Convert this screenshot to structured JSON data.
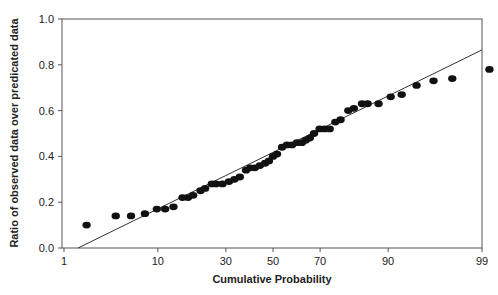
{
  "chart_data": {
    "type": "scatter",
    "title": "",
    "xlabel": "Cumulative Probability",
    "ylabel": "Ratio of observed data over predicated data",
    "x_scale": "normal-probability",
    "xlim": [
      1,
      99
    ],
    "ylim": [
      0.0,
      1.0
    ],
    "x_ticks": [
      1,
      10,
      30,
      50,
      70,
      90,
      99
    ],
    "y_ticks": [
      "0.0",
      "0.2",
      "0.4",
      "0.6",
      "0.8",
      "1.0"
    ],
    "grid": false,
    "legend": "none",
    "series": [
      {
        "name": "observed",
        "points": [
          [
            1.9,
            0.1
          ],
          [
            4.0,
            0.14
          ],
          [
            5.7,
            0.14
          ],
          [
            7.7,
            0.15
          ],
          [
            9.8,
            0.17
          ],
          [
            11.5,
            0.17
          ],
          [
            13.4,
            0.18
          ],
          [
            15.7,
            0.22
          ],
          [
            17.2,
            0.22
          ],
          [
            18.7,
            0.23
          ],
          [
            21.0,
            0.25
          ],
          [
            22.5,
            0.26
          ],
          [
            24.8,
            0.28
          ],
          [
            26.3,
            0.28
          ],
          [
            28.7,
            0.28
          ],
          [
            31.2,
            0.29
          ],
          [
            33.4,
            0.3
          ],
          [
            35.6,
            0.31
          ],
          [
            38.2,
            0.34
          ],
          [
            40.0,
            0.35
          ],
          [
            42.0,
            0.35
          ],
          [
            44.2,
            0.36
          ],
          [
            46.5,
            0.37
          ],
          [
            48.2,
            0.38
          ],
          [
            50.0,
            0.4
          ],
          [
            51.8,
            0.41
          ],
          [
            54.0,
            0.44
          ],
          [
            56.2,
            0.45
          ],
          [
            58.4,
            0.45
          ],
          [
            60.5,
            0.46
          ],
          [
            62.6,
            0.46
          ],
          [
            64.2,
            0.47
          ],
          [
            65.9,
            0.48
          ],
          [
            67.6,
            0.5
          ],
          [
            69.8,
            0.52
          ],
          [
            71.7,
            0.52
          ],
          [
            73.6,
            0.52
          ],
          [
            75.6,
            0.55
          ],
          [
            77.4,
            0.56
          ],
          [
            79.9,
            0.6
          ],
          [
            81.6,
            0.61
          ],
          [
            83.9,
            0.63
          ],
          [
            85.4,
            0.63
          ],
          [
            88.0,
            0.63
          ],
          [
            90.5,
            0.66
          ],
          [
            92.4,
            0.67
          ],
          [
            94.5,
            0.71
          ],
          [
            96.3,
            0.73
          ],
          [
            97.7,
            0.74
          ],
          [
            99.2,
            0.78
          ]
        ]
      }
    ],
    "fit_line": {
      "name": "fitted line",
      "points": [
        [
          1.5,
          0.0
        ],
        [
          99,
          0.865
        ]
      ]
    }
  }
}
